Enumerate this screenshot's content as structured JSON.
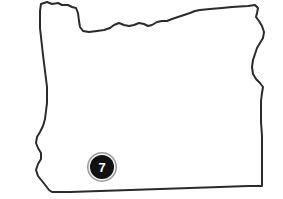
{
  "map": {
    "region_name": "Oregon",
    "shape_icon": "state-outline-icon",
    "background_color": "#ffffff",
    "fill_color": "#ffffff",
    "outline_color": "#2b2b2b",
    "outline_width": 2,
    "markers": [
      {
        "label": "7",
        "icon": "numbered-map-pin-icon",
        "x": 102,
        "y": 167,
        "radius": 15,
        "disc_color": "#111111",
        "ring_color": "#9a9a9a",
        "label_color": "#ffffff"
      }
    ]
  }
}
